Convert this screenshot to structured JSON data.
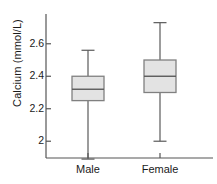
{
  "chart_data": {
    "type": "box",
    "title": "",
    "xlabel": "",
    "ylabel": "Calcium (mmol/L)",
    "categories": [
      "Male",
      "Female"
    ],
    "ytick_labels": [
      "2",
      "2.2",
      "2.4",
      "2.6"
    ],
    "ytick_values": [
      2.0,
      2.2,
      2.4,
      2.6
    ],
    "ylim": [
      1.88,
      2.78
    ],
    "grid": false,
    "legend": null,
    "series": [
      {
        "name": "Male",
        "whisker_low": 1.89,
        "q1": 2.25,
        "median": 2.32,
        "q3": 2.4,
        "whisker_high": 2.56
      },
      {
        "name": "Female",
        "whisker_low": 2.0,
        "q1": 2.3,
        "median": 2.4,
        "q3": 2.5,
        "whisker_high": 2.73
      }
    ]
  },
  "style": {
    "box_fill": "#e3e3e3",
    "box_stroke": "#808080",
    "line_color": "#5a5a5a",
    "axis_color": "#555555",
    "text_color": "#1a1a1a"
  }
}
